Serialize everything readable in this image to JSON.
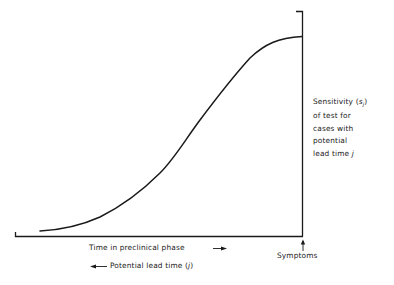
{
  "diagram": {
    "type": "sensitivity curve",
    "y_axis_label": {
      "line1_prefix": "Sensitivity (",
      "line1_symbol": "s",
      "line1_subscript": "j",
      "line1_suffix": ")",
      "line2": "of test for",
      "line3": "cases with",
      "line4": "potential",
      "line5_prefix": "lead time ",
      "line5_symbol": "j"
    },
    "x_axis_label_forward": {
      "text": "Time in preclinical phase",
      "arrow": "→"
    },
    "x_axis_label_backward": {
      "arrow": "←",
      "text_prefix": "Potential lead time (",
      "symbol": "j",
      "text_suffix": ")"
    },
    "event_marker": {
      "label": "Symptoms",
      "arrow": "↑"
    },
    "curve_description": "S-shaped increasing curve from near zero to a plateau at the time of symptoms",
    "line_color": "#1a1a1a",
    "background_color": "#ffffff"
  }
}
